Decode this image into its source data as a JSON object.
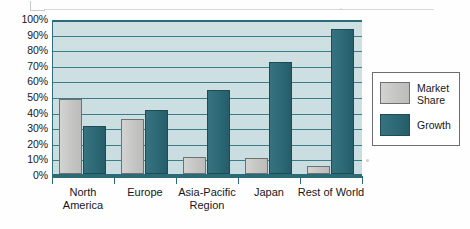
{
  "chart_data": {
    "type": "bar",
    "title": "",
    "xlabel": "",
    "ylabel": "",
    "categories": [
      "North America",
      "Europe",
      "Asia-Pacific Region",
      "Japan",
      "Rest of World"
    ],
    "series": [
      {
        "name": "Market Share",
        "color": "#c5c5c3",
        "values": [
          48,
          35,
          11,
          10,
          5
        ]
      },
      {
        "name": "Growth",
        "color": "#2c6975",
        "values": [
          31,
          41,
          54,
          72,
          93
        ]
      }
    ],
    "ylim": [
      0,
      100
    ],
    "ytick_labels": [
      "100%",
      "90%",
      "80%",
      "70%",
      "60%",
      "50%",
      "40%",
      "30%",
      "20%",
      "10%",
      "0%"
    ],
    "ytick_values": [
      100,
      90,
      80,
      70,
      60,
      50,
      40,
      30,
      20,
      10,
      0
    ],
    "grid": true,
    "legend_position": "right",
    "legend_entries": [
      "Market Share",
      "Growth"
    ],
    "plot_background": "#c9dde0",
    "axis_color": "#2b6b78"
  },
  "axis": {
    "y_labels": [
      "100%",
      "90%",
      "80%",
      "70%",
      "60%",
      "50%",
      "40%",
      "30%",
      "20%",
      "10%",
      "0%"
    ],
    "x_labels": [
      "North\nAmerica",
      "Europe",
      "Asia-Pacific\nRegion",
      "Japan",
      "Rest of World"
    ]
  },
  "legend": {
    "items": [
      {
        "label": "Market\nShare"
      },
      {
        "label": "Growth"
      }
    ]
  }
}
